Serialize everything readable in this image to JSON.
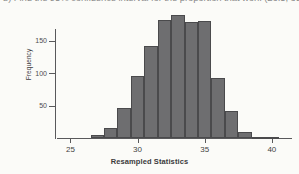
{
  "page": {
    "background": "#fbfbf8",
    "top_text_line": "b) Find the 95% confidence interval for the proportion that won. (26.5, 39.5)"
  },
  "figure": {
    "y_axis_title": "Frequency",
    "x_axis_title": "Resampled Statistics",
    "bar_fill": "#6e6e70",
    "bar_stroke": "#4a4a4c",
    "axis_color": "#59595b"
  },
  "chart_data": {
    "type": "bar",
    "title": "",
    "subtitle": "",
    "xlabel": "Resampled Statistics",
    "ylabel": "Frequency",
    "xlim": [
      24,
      41.5
    ],
    "ylim": [
      0,
      200
    ],
    "xticks": [
      25,
      30,
      35,
      40
    ],
    "yticks": [
      50,
      100,
      150
    ],
    "grid": false,
    "legend": null,
    "bin_width": 1,
    "bin_starts": [
      26.5,
      27.5,
      28.5,
      29.5,
      30.5,
      31.5,
      32.5,
      33.5,
      34.5,
      35.5,
      36.5,
      37.5,
      38.5,
      39.5
    ],
    "categories": [
      "26.5-27.5",
      "27.5-28.5",
      "28.5-29.5",
      "29.5-30.5",
      "30.5-31.5",
      "31.5-32.5",
      "32.5-33.5",
      "33.5-34.5",
      "34.5-35.5",
      "35.5-36.5",
      "36.5-37.5",
      "37.5-38.5",
      "38.5-39.5",
      "39.5-40.5"
    ],
    "values": [
      4,
      16,
      46,
      96,
      142,
      181,
      189,
      178,
      180,
      92,
      41,
      9,
      2,
      1
    ]
  }
}
